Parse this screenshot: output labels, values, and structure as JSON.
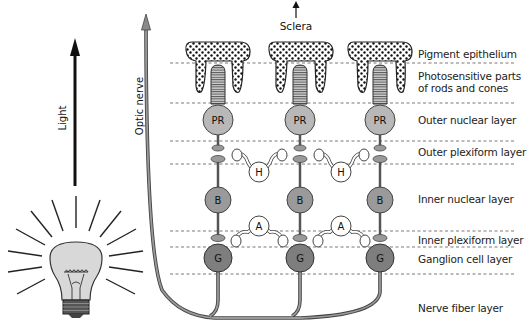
{
  "diagram": {
    "top_arrow_label": "Sclera",
    "light_label": "Light",
    "optic_nerve_label": "Optic nerve",
    "layers": [
      {
        "id": "pigment",
        "label": "Pigment epithelium"
      },
      {
        "id": "photosensitive",
        "label": "Photosensitive parts of rods and cones"
      },
      {
        "id": "outer-nuclear",
        "label": "Outer nuclear layer"
      },
      {
        "id": "outer-plexiform",
        "label": "Outer plexiform layer"
      },
      {
        "id": "inner-nuclear",
        "label": "Inner nuclear layer"
      },
      {
        "id": "inner-plexiform",
        "label": "Inner plexiform layer"
      },
      {
        "id": "ganglion",
        "label": "Ganglion cell layer"
      },
      {
        "id": "nerve-fiber",
        "label": "Nerve fiber layer"
      }
    ],
    "cells": {
      "photoreceptor": "PR",
      "bipolar": "B",
      "ganglion": "G",
      "horizontal": "H",
      "amacrine": "A"
    },
    "colors": {
      "photoreceptor": "#b8b8b8",
      "bipolar": "#9a9a9a",
      "ganglion": "#7e7e7e",
      "interneuron": "#ffffff",
      "nerve": "#8a8a8a",
      "bulb": "#d8d8d8"
    }
  }
}
